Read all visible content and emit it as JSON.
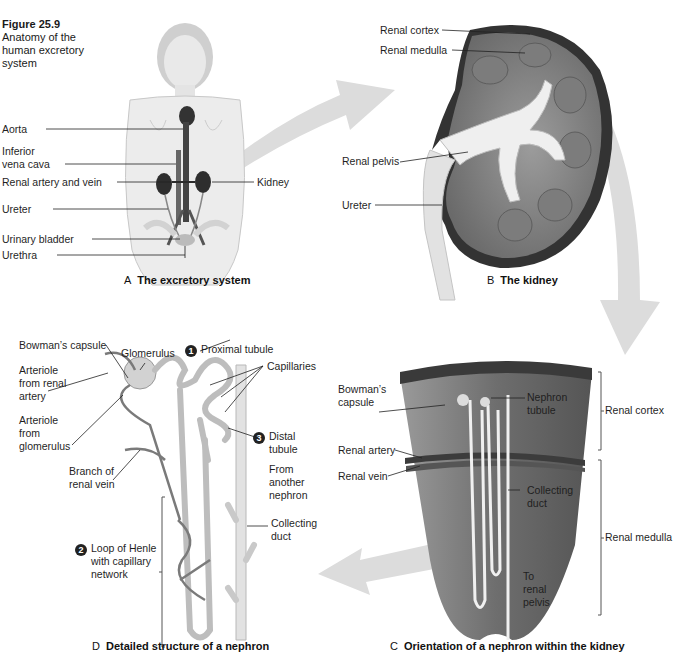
{
  "figure": {
    "number": "Figure 25.9",
    "caption": "Anatomy of the human excretory system"
  },
  "panels": {
    "A": {
      "letter": "A",
      "title": "The excretory system",
      "labels": {
        "aorta": "Aorta",
        "ivc_line1": "Inferior",
        "ivc_line2": "vena cava",
        "renal_artery_vein": "Renal artery and vein",
        "kidney": "Kidney",
        "ureter": "Ureter",
        "urinary_bladder": "Urinary bladder",
        "urethra": "Urethra"
      }
    },
    "B": {
      "letter": "B",
      "title": "The kidney",
      "labels": {
        "renal_cortex": "Renal cortex",
        "renal_medulla": "Renal medulla",
        "renal_pelvis": "Renal pelvis",
        "ureter": "Ureter"
      }
    },
    "C": {
      "letter": "C",
      "title": "Orientation of a nephron within the kidney",
      "labels": {
        "bowmans_line1": "Bowman’s",
        "bowmans_line2": "capsule",
        "nephron_line1": "Nephron",
        "nephron_line2": "tubule",
        "renal_cortex": "Renal cortex",
        "renal_artery": "Renal artery",
        "renal_vein": "Renal vein",
        "collecting_line1": "Collecting",
        "collecting_line2": "duct",
        "renal_medulla": "Renal medulla",
        "to_line1": "To",
        "to_line2": "renal",
        "to_line3": "pelvis"
      }
    },
    "D": {
      "letter": "D",
      "title": "Detailed structure of a nephron",
      "labels": {
        "bowmans_capsule": "Bowman’s capsule",
        "glomerulus": "Glomerulus",
        "step1_num": "1",
        "proximal_tubule": "Proximal tubule",
        "capillaries": "Capillaries",
        "arteriole_renal_1": "Arteriole",
        "arteriole_renal_2": "from renal",
        "arteriole_renal_3": "artery",
        "arteriole_glom_1": "Arteriole",
        "arteriole_glom_2": "from",
        "arteriole_glom_3": "glomerulus",
        "step3_num": "3",
        "distal_1": "Distal",
        "distal_2": "tubule",
        "branch_1": "Branch of",
        "branch_2": "renal vein",
        "from_1": "From",
        "from_2": "another",
        "from_3": "nephron",
        "collecting_1": "Collecting",
        "collecting_2": "duct",
        "step2_num": "2",
        "loop_1": "Loop of Henle",
        "loop_2": "with capillary",
        "loop_3": "network"
      }
    }
  },
  "colors": {
    "ink": "#1f1f1f",
    "arrow_fill": "#d9d9d9",
    "tissue_dark": "#5a5a5a",
    "tissue_mid": "#8a8a8a",
    "tissue_light": "#c8c8c8",
    "tubule": "#e6e6e6"
  }
}
